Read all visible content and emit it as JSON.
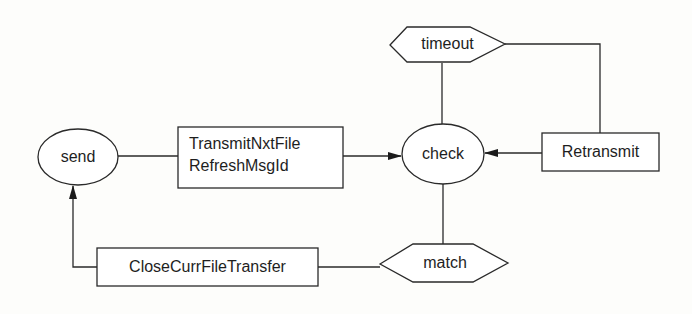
{
  "diagram": {
    "type": "state-flow",
    "nodes": {
      "send": {
        "label": "send",
        "shape": "ellipse"
      },
      "transmit": {
        "lines": [
          "TransmitNxtFile",
          "RefreshMsgId"
        ],
        "shape": "rectangle"
      },
      "check": {
        "label": "check",
        "shape": "ellipse"
      },
      "timeout": {
        "label": "timeout",
        "shape": "hexagon"
      },
      "retransmit": {
        "label": "Retransmit",
        "shape": "rectangle"
      },
      "match": {
        "label": "match",
        "shape": "hexagon"
      },
      "close": {
        "label": "CloseCurrFileTransfer",
        "shape": "rectangle"
      }
    },
    "edges": [
      {
        "from": "send",
        "to": "transmit",
        "arrow": false
      },
      {
        "from": "transmit",
        "to": "check",
        "arrow": true
      },
      {
        "from": "check",
        "to": "timeout",
        "arrow": false
      },
      {
        "from": "timeout",
        "to": "retransmit",
        "arrow": false
      },
      {
        "from": "retransmit",
        "to": "check",
        "arrow": true
      },
      {
        "from": "check",
        "to": "match",
        "arrow": false
      },
      {
        "from": "match",
        "to": "close",
        "arrow": false
      },
      {
        "from": "close",
        "to": "send",
        "arrow": true
      }
    ],
    "colors": {
      "line": "#2a2a2a",
      "text": "#1e1e1e",
      "background": "#fdfdfb"
    }
  }
}
